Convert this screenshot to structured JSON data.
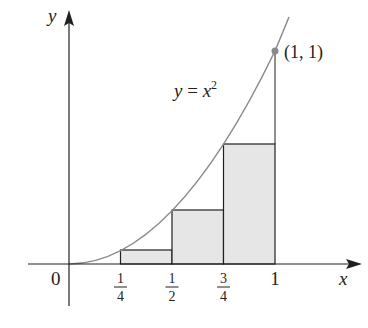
{
  "figure": {
    "function_label": {
      "lhs": "y",
      "eq": " = ",
      "base": "x",
      "exp": "2"
    },
    "point_label": "(1, 1)",
    "axes": {
      "x_label": "x",
      "y_label": "y",
      "origin_label": "0",
      "x_ticks": [
        {
          "num": "1",
          "den": "4",
          "value": 0.25
        },
        {
          "num": "1",
          "den": "2",
          "value": 0.5
        },
        {
          "num": "3",
          "den": "4",
          "value": 0.75
        }
      ],
      "x_one_label": "1"
    },
    "rectangles": [
      {
        "x0": 0.25,
        "x1": 0.5,
        "height": 0.0625
      },
      {
        "x0": 0.5,
        "x1": 0.75,
        "height": 0.25
      },
      {
        "x0": 0.75,
        "x1": 1.0,
        "height": 0.5625
      }
    ],
    "colors": {
      "curve": "#8a8a8a",
      "axis": "#231f20",
      "rect_fill": "#e6e6e6",
      "rect_stroke": "#231f20",
      "point": "#8a8a8a"
    }
  }
}
